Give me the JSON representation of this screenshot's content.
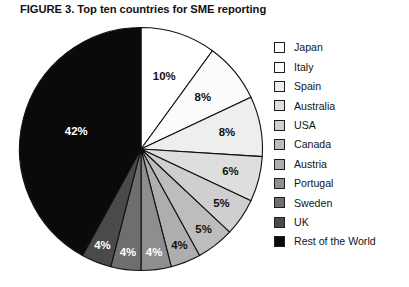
{
  "figure": {
    "title": "FIGURE 3. Top ten countries for SME reporting",
    "background_color": "#ffffff",
    "outline_color": "#111111"
  },
  "chart_data": {
    "type": "pie",
    "title": "FIGURE 3. Top ten countries for SME reporting",
    "xlabel": "",
    "ylabel": "",
    "legend_position": "right",
    "start_angle_deg": 0,
    "direction": "clockwise",
    "categories": [
      "Japan",
      "Italy",
      "Spain",
      "Australia",
      "USA",
      "Canada",
      "Austria",
      "Portugal",
      "Sweden",
      "UK",
      "Rest of the World"
    ],
    "values": [
      10,
      8,
      8,
      6,
      5,
      5,
      4,
      4,
      4,
      4,
      42
    ],
    "data_labels": [
      "10%",
      "8%",
      "8%",
      "6%",
      "5%",
      "5%",
      "4%",
      "4%",
      "4%",
      "4%",
      "42%"
    ],
    "slice_colors": [
      "#ffffff",
      "#fbfbfb",
      "#eeeeee",
      "#dedede",
      "#cfcfcf",
      "#bdbdbd",
      "#aeaeae",
      "#8e8e8e",
      "#6e6e6e",
      "#4a4a4a",
      "#0a0a0a"
    ],
    "label_text_colors": [
      "#111111",
      "#111111",
      "#111111",
      "#111111",
      "#111111",
      "#111111",
      "#111111",
      "#ffffff",
      "#ffffff",
      "#ffffff",
      "#ffffff"
    ]
  },
  "legend": {
    "items": [
      {
        "label": "Japan",
        "color": "#ffffff"
      },
      {
        "label": "Italy",
        "color": "#fbfbfb"
      },
      {
        "label": "Spain",
        "color": "#eeeeee"
      },
      {
        "label": "Australia",
        "color": "#dedede"
      },
      {
        "label": "USA",
        "color": "#cfcfcf"
      },
      {
        "label": "Canada",
        "color": "#bdbdbd"
      },
      {
        "label": "Austria",
        "color": "#aeaeae"
      },
      {
        "label": "Portugal",
        "color": "#8e8e8e"
      },
      {
        "label": "Sweden",
        "color": "#6e6e6e"
      },
      {
        "label": "UK",
        "color": "#4a4a4a"
      },
      {
        "label": "Rest of the World",
        "color": "#0a0a0a"
      }
    ]
  }
}
